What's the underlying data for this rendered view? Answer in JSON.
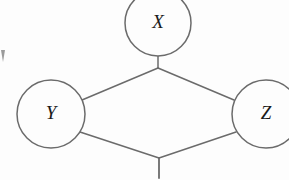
{
  "diagram": {
    "type": "node-link-graph",
    "background_color": "#fdfdfd",
    "stroke_color": "#6b6b6b",
    "label_color": "#1a1a1a",
    "stroke_width": 1.5,
    "label_font_size": 19,
    "nodes": [
      {
        "id": "X",
        "label": "X",
        "cx": 158,
        "cy": 23,
        "r": 33,
        "cropped": "top"
      },
      {
        "id": "Y",
        "label": "Y",
        "cx": 51,
        "cy": 114,
        "r": 34,
        "cropped": "none"
      },
      {
        "id": "Z",
        "label": "Z",
        "cx": 266,
        "cy": 114,
        "r": 34,
        "cropped": "right"
      }
    ],
    "vertices": {
      "top_junction": {
        "x": 158,
        "y": 68
      },
      "bottom_junction": {
        "x": 159,
        "y": 158
      }
    },
    "edges": [
      {
        "id": "x-to-top-junction",
        "from": "X",
        "to": "top_junction",
        "x1": 158,
        "y1": 56,
        "x2": 158,
        "y2": 68
      },
      {
        "id": "top-junction-to-y",
        "from": "top_junction",
        "to": "Y",
        "x1": 158,
        "y1": 68,
        "x2": 82,
        "y2": 100
      },
      {
        "id": "top-junction-to-z",
        "from": "top_junction",
        "to": "Z",
        "x1": 158,
        "y1": 68,
        "x2": 234,
        "y2": 100
      },
      {
        "id": "y-to-bottom-junction",
        "from": "Y",
        "to": "bottom_junction",
        "x1": 80,
        "y1": 132,
        "x2": 159,
        "y2": 158
      },
      {
        "id": "z-to-bottom-junction",
        "from": "Z",
        "to": "bottom_junction",
        "x1": 236,
        "y1": 132,
        "x2": 159,
        "y2": 158
      },
      {
        "id": "bottom-junction-stub",
        "from": "bottom_junction",
        "to": "edge-of-frame",
        "x1": 159,
        "y1": 158,
        "x2": 159,
        "y2": 178
      }
    ],
    "artifacts": [
      {
        "id": "left-edge-mark",
        "x": 1,
        "y": 48,
        "width": 6,
        "height": 14
      }
    ]
  }
}
